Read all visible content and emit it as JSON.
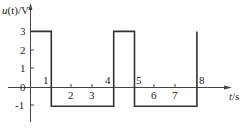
{
  "chart_data": {
    "type": "line",
    "title": "",
    "xlabel": "t/s",
    "ylabel": "u(t)/V",
    "x_ticks": [
      "1",
      "2",
      "3",
      "4",
      "5",
      "6",
      "7",
      "8"
    ],
    "y_ticks": [
      "3",
      "2",
      "1",
      "0",
      "-1"
    ],
    "origin_label": "0",
    "series": [
      {
        "name": "u(t)",
        "style": "rectangular pulse waveform",
        "points": [
          [
            0,
            3
          ],
          [
            1,
            3
          ],
          [
            1,
            -1
          ],
          [
            4,
            -1
          ],
          [
            4,
            3
          ],
          [
            5,
            3
          ],
          [
            5,
            -1
          ],
          [
            8,
            -1
          ],
          [
            8,
            3
          ]
        ]
      }
    ],
    "xlim": [
      0,
      9.5
    ],
    "ylim": [
      -2,
      4
    ],
    "grid": false,
    "legend": "none"
  },
  "axes": {
    "y_label_prefix": "u",
    "y_label_paren": "(t)",
    "y_label_unit": "/V",
    "x_label_var": "t",
    "x_label_unit": "/s"
  },
  "colors": {
    "line": "#333333",
    "axis": "#444444",
    "text": "#222222"
  }
}
